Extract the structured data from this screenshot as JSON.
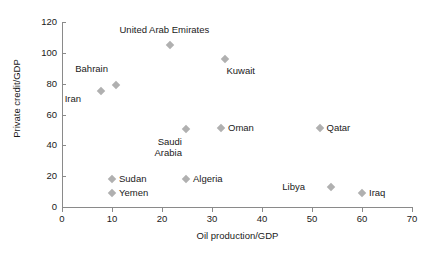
{
  "chart_data": {
    "type": "scatter",
    "title": "",
    "xlabel": "Oil production/GDP",
    "ylabel": "Private credit/GDP",
    "xlim": [
      0,
      70
    ],
    "ylim": [
      0,
      120
    ],
    "xticks": [
      0,
      10,
      20,
      30,
      40,
      50,
      60,
      70
    ],
    "yticks": [
      0,
      20,
      40,
      60,
      80,
      100,
      120
    ],
    "grid": false,
    "legend": "none",
    "marker_color": "#b0b0b0",
    "axis_color": "#8a8a8a",
    "points": [
      {
        "label": "Iran",
        "x": 7.8,
        "y": 75,
        "label_dx": -26,
        "label_dy": 8
      },
      {
        "label": "Bahrain",
        "x": 10.8,
        "y": 79,
        "label_dx": -14,
        "label_dy": -16
      },
      {
        "label": "United Arab Emirates",
        "x": 21.5,
        "y": 105,
        "label_dx": -10,
        "label_dy": -15
      },
      {
        "label": "Kuwait",
        "x": 32.5,
        "y": 96,
        "label_dx": 2,
        "label_dy": 12
      },
      {
        "label": "Saudi\nArabia",
        "x": 24.8,
        "y": 50.5,
        "label_dx": -10,
        "label_dy": 13
      },
      {
        "label": "Oman",
        "x": 31.8,
        "y": 51.5,
        "label_dx": 7,
        "label_dy": 0
      },
      {
        "label": "Qatar",
        "x": 51.5,
        "y": 51.5,
        "label_dx": 7,
        "label_dy": 0
      },
      {
        "label": "Sudan",
        "x": 10.0,
        "y": 18.3,
        "label_dx": 7,
        "label_dy": 0
      },
      {
        "label": "Yemen",
        "x": 10.0,
        "y": 9.0,
        "label_dx": 7,
        "label_dy": 0
      },
      {
        "label": "Algeria",
        "x": 24.8,
        "y": 18.3,
        "label_dx": 7,
        "label_dy": 0
      },
      {
        "label": "Libya",
        "x": 53.8,
        "y": 13.0,
        "label_dx": -32,
        "label_dy": 0
      },
      {
        "label": "Iraq",
        "x": 60.0,
        "y": 9.0,
        "label_dx": 7,
        "label_dy": 0
      }
    ]
  }
}
